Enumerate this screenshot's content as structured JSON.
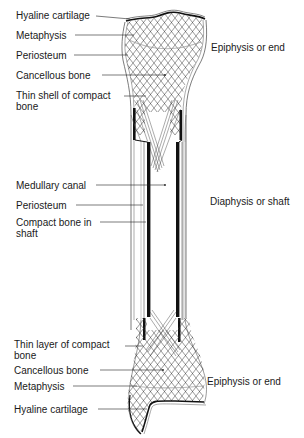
{
  "left_labels": {
    "top": [
      {
        "id": "hyaline-cartilage-top",
        "text": "Hyaline cartilage"
      },
      {
        "id": "metaphysis-top",
        "text": "Metaphysis"
      },
      {
        "id": "periosteum-top",
        "text": "Periosteum"
      },
      {
        "id": "cancellous-bone-top",
        "text": "Cancellous bone"
      },
      {
        "id": "thin-shell-compact-bone",
        "text": "Thin shell of compact bone"
      }
    ],
    "middle": [
      {
        "id": "medullary-canal",
        "text": "Medullary canal"
      },
      {
        "id": "periosteum-mid",
        "text": "Periosteum"
      },
      {
        "id": "compact-bone-shaft",
        "text": "Compact bone in shaft"
      }
    ],
    "bottom": [
      {
        "id": "thin-layer-compact-bone",
        "text": "Thin layer of compact bone"
      },
      {
        "id": "cancellous-bone-bottom",
        "text": "Cancellous bone"
      },
      {
        "id": "metaphysis-bottom",
        "text": "Metaphysis"
      },
      {
        "id": "hyaline-cartilage-bottom",
        "text": "Hyaline cartilage"
      }
    ]
  },
  "right_labels": {
    "epiphysis_top": "Epiphysis or end",
    "diaphysis": "Diaphysis or shaft",
    "epiphysis_bottom": "Epiphysis or end"
  },
  "colors": {
    "ink": "#1a1a1a",
    "background": "#ffffff"
  }
}
